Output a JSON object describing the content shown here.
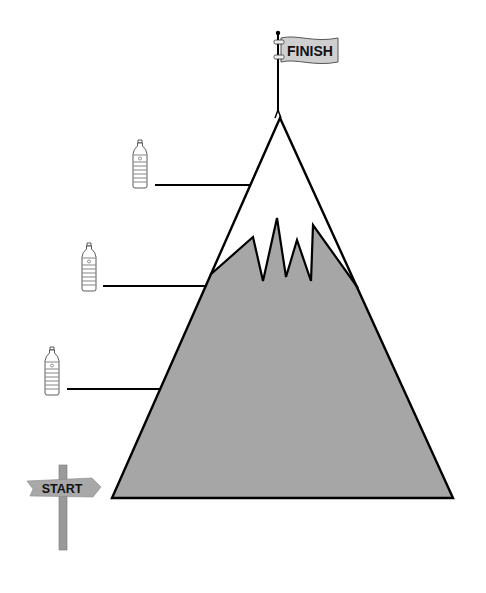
{
  "diagram": {
    "finish_flag": {
      "label": "FINISH",
      "color": "#cfcfcf"
    },
    "start_sign": {
      "label": "START",
      "color": "#a8a8a8",
      "post_color": "#9a9a9a"
    },
    "mountain": {
      "rock_color": "#a6a6a6",
      "snow_color": "#ffffff",
      "outline_color": "#000000"
    },
    "checkpoints": [
      {
        "icon": "water-bottle-icon",
        "level": "high"
      },
      {
        "icon": "water-bottle-icon",
        "level": "middle"
      },
      {
        "icon": "water-bottle-icon",
        "level": "low"
      }
    ]
  }
}
